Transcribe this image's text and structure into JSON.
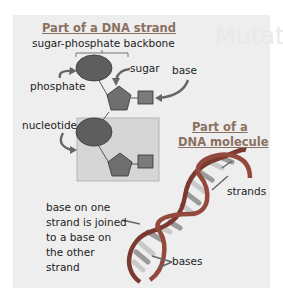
{
  "strand_section": {
    "title": "Part of a DNA strand",
    "labels": {
      "backbone": "sugar-phosphate backbone",
      "phosphate": "phosphate",
      "sugar": "sugar",
      "base": "base",
      "nucleotide": "nucleotide"
    }
  },
  "molecule_section": {
    "title_line1": "Part of a",
    "title_line2": "DNA molecule",
    "labels": {
      "strands": "strands",
      "bases": "bases",
      "join_lines": [
        "base on one",
        "strand is joined",
        "to a base on",
        "the other",
        "strand"
      ]
    }
  },
  "background_text": "Mutations",
  "colors": {
    "phosphate": "#5e5e5e",
    "sugar": "#6f6f6f",
    "base": "#7a7a7a",
    "panel": "#eeeeee",
    "nucleotide_box": "#d6d6d6",
    "title": "#8a7060",
    "helix": "#7a3a30"
  }
}
